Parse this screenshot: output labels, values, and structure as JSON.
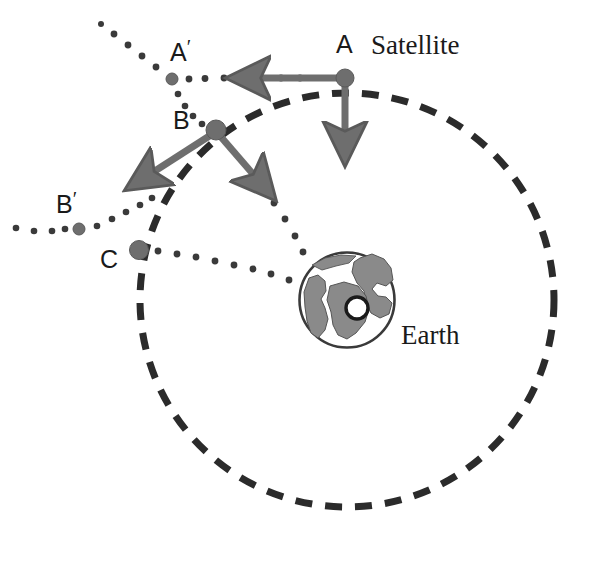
{
  "figure": {
    "type": "physics-diagram",
    "background_color": "#ffffff",
    "ink_color": "#3c3c3c",
    "dark_ink_color": "#1a1a1a",
    "fill_gray": "#808080"
  },
  "labels": {
    "satellite": "Satellite",
    "earth": "Earth",
    "center": "O",
    "point_a": "A",
    "point_a_prime": "A",
    "point_a_prime_mark": "′",
    "point_b": "B",
    "point_b_prime": "B",
    "point_b_prime_mark": "′",
    "point_c": "C"
  },
  "geometry": {
    "orbit": {
      "center_x": 347,
      "center_y": 300,
      "radius": 207,
      "style": "dashed",
      "dash": "17 13",
      "stroke_width": 7,
      "color": "#2b2b2b"
    },
    "earth": {
      "center_x": 347,
      "center_y": 300,
      "radius": 48,
      "outline_color": "#3a3a3a",
      "land_color": "#8a8a8a"
    },
    "points": [
      {
        "name": "A",
        "x": 345,
        "y": 78,
        "r": 9,
        "fill": "#6e6e6e",
        "on_orbit": true
      },
      {
        "name": "B",
        "x": 216,
        "y": 130,
        "r": 10,
        "fill": "#6e6e6e",
        "on_orbit": true
      },
      {
        "name": "C",
        "x": 139,
        "y": 250,
        "r": 9.5,
        "fill": "#6e6e6e",
        "on_orbit": true
      },
      {
        "name": "A′",
        "x": 172,
        "y": 79,
        "r": 6,
        "fill": "#6e6e6e",
        "on_orbit": false
      },
      {
        "name": "B′",
        "x": 79,
        "y": 229,
        "r": 6,
        "fill": "#6e6e6e",
        "on_orbit": false
      }
    ],
    "vectors": [
      {
        "name": "velocity-at-A",
        "from_x": 345,
        "from_y": 78,
        "to_x": 213,
        "to_y": 78,
        "meaning": "tangential-velocity"
      },
      {
        "name": "gravity-at-A",
        "from_x": 345,
        "from_y": 80,
        "to_x": 345,
        "to_y": 196,
        "meaning": "gravitational-pull"
      },
      {
        "name": "velocity-at-B",
        "from_x": 216,
        "from_y": 132,
        "to_x": 112,
        "to_y": 200,
        "meaning": "tangential-velocity"
      },
      {
        "name": "gravity-at-B",
        "from_x": 219,
        "from_y": 134,
        "to_x": 290,
        "to_y": 215,
        "meaning": "gravitational-pull"
      }
    ],
    "dotted_paths": [
      {
        "name": "path-A-to-Aprime",
        "points": [
          [
            300,
            78
          ],
          [
            172,
            79
          ],
          [
            146,
            62
          ],
          [
            128,
            46
          ],
          [
            113,
            30
          ]
        ]
      },
      {
        "name": "path-Aprime-to-B",
        "points": [
          [
            172,
            79
          ],
          [
            183,
            100
          ],
          [
            196,
            117
          ],
          [
            213,
            130
          ]
        ]
      },
      {
        "name": "path-B-to-earth",
        "points": [
          [
            228,
            145
          ],
          [
            260,
            186
          ],
          [
            285,
            222
          ],
          [
            306,
            256
          ]
        ]
      },
      {
        "name": "path-C-to-earth",
        "points": [
          [
            152,
            250
          ],
          [
            200,
            258
          ],
          [
            250,
            268
          ],
          [
            296,
            282
          ]
        ]
      },
      {
        "name": "path-Bprime-line",
        "points": [
          [
            14,
            228
          ],
          [
            79,
            229
          ],
          [
            118,
            216
          ],
          [
            150,
            199
          ]
        ]
      }
    ]
  },
  "label_positions": {
    "satellite": {
      "x": 371,
      "y": 32
    },
    "earth": {
      "x": 401,
      "y": 322
    },
    "center": {
      "x": 358,
      "y": 302
    },
    "point_a": {
      "x": 336,
      "y": 32
    },
    "point_a_prime": {
      "x": 170,
      "y": 40
    },
    "point_b": {
      "x": 173,
      "y": 108
    },
    "point_b_prime": {
      "x": 56,
      "y": 192
    },
    "point_c": {
      "x": 100,
      "y": 247
    }
  }
}
